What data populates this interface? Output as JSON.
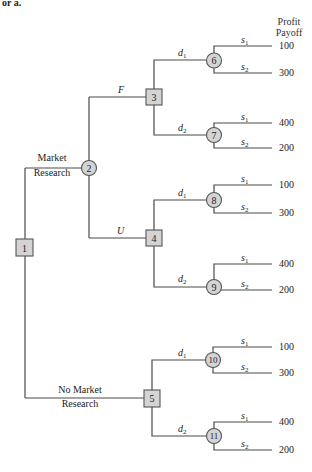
{
  "cut_text": "or a.",
  "header": {
    "line1": "Profit",
    "line2": "Payoff"
  },
  "root": {
    "id": "1"
  },
  "branches": {
    "market_research": {
      "line1": "Market",
      "line2": "Research"
    },
    "no_market_research": {
      "line1": "No Market",
      "line2": "Research"
    },
    "favorable": "F",
    "unfavorable": "U"
  },
  "decision_nodes": [
    {
      "id": "1"
    },
    {
      "id": "3"
    },
    {
      "id": "4"
    },
    {
      "id": "5"
    }
  ],
  "chance_nodes": [
    {
      "id": "2"
    },
    {
      "id": "6"
    },
    {
      "id": "7"
    },
    {
      "id": "8"
    },
    {
      "id": "9"
    },
    {
      "id": "10"
    },
    {
      "id": "11"
    }
  ],
  "decisions": {
    "d1": "d",
    "d1_sub": "1",
    "d2": "d",
    "d2_sub": "2"
  },
  "states": {
    "s1": "s",
    "s1_sub": "1",
    "s2": "s",
    "s2_sub": "2"
  },
  "payoffs": {
    "n6": [
      "100",
      "300"
    ],
    "n7": [
      "400",
      "200"
    ],
    "n8": [
      "100",
      "300"
    ],
    "n9": [
      "400",
      "200"
    ],
    "n10": [
      "100",
      "300"
    ],
    "n11": [
      "400",
      "200"
    ]
  },
  "tree_structure": {
    "1": {
      "type": "decision",
      "children": [
        {
          "label": "Market Research",
          "to": "2"
        },
        {
          "label": "No Market Research",
          "to": "5"
        }
      ]
    },
    "2": {
      "type": "chance",
      "children": [
        {
          "label": "F",
          "to": "3"
        },
        {
          "label": "U",
          "to": "4"
        }
      ]
    },
    "3": {
      "type": "decision",
      "children": [
        {
          "label": "d1",
          "to": "6"
        },
        {
          "label": "d2",
          "to": "7"
        }
      ]
    },
    "4": {
      "type": "decision",
      "children": [
        {
          "label": "d1",
          "to": "8"
        },
        {
          "label": "d2",
          "to": "9"
        }
      ]
    },
    "5": {
      "type": "decision",
      "children": [
        {
          "label": "d1",
          "to": "10"
        },
        {
          "label": "d2",
          "to": "11"
        }
      ]
    },
    "6": {
      "type": "chance",
      "outcomes": [
        {
          "state": "s1",
          "payoff": 100
        },
        {
          "state": "s2",
          "payoff": 300
        }
      ]
    },
    "7": {
      "type": "chance",
      "outcomes": [
        {
          "state": "s1",
          "payoff": 400
        },
        {
          "state": "s2",
          "payoff": 200
        }
      ]
    },
    "8": {
      "type": "chance",
      "outcomes": [
        {
          "state": "s1",
          "payoff": 100
        },
        {
          "state": "s2",
          "payoff": 300
        }
      ]
    },
    "9": {
      "type": "chance",
      "outcomes": [
        {
          "state": "s1",
          "payoff": 400
        },
        {
          "state": "s2",
          "payoff": 200
        }
      ]
    },
    "10": {
      "type": "chance",
      "outcomes": [
        {
          "state": "s1",
          "payoff": 100
        },
        {
          "state": "s2",
          "payoff": 300
        }
      ]
    },
    "11": {
      "type": "chance",
      "outcomes": [
        {
          "state": "s1",
          "payoff": 400
        },
        {
          "state": "s2",
          "payoff": 200
        }
      ]
    }
  }
}
